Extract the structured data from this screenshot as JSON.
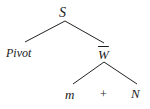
{
  "diagram": {
    "type": "syntax-tree",
    "root": {
      "label": "S",
      "children": [
        {
          "label": "Pivot"
        },
        {
          "label": "W",
          "overline": true,
          "children": [
            {
              "label": "m"
            },
            {
              "label": "+"
            },
            {
              "label": "N"
            }
          ]
        }
      ]
    },
    "labels": {
      "s": "S",
      "pivot": "Pivot",
      "w": "W",
      "m": "m",
      "plus": "+",
      "n": "N"
    },
    "edges": [
      {
        "from": "S",
        "to": "Pivot",
        "x1": 65,
        "y1": 21,
        "x2": 25,
        "y2": 42
      },
      {
        "from": "S",
        "to": "W",
        "x1": 65,
        "y1": 21,
        "x2": 104,
        "y2": 43
      },
      {
        "from": "W",
        "to": "m",
        "x1": 104,
        "y1": 62,
        "x2": 73,
        "y2": 84
      },
      {
        "from": "W",
        "to": "N",
        "x1": 104,
        "y1": 62,
        "x2": 137,
        "y2": 84
      }
    ],
    "line_color": "#222222"
  }
}
